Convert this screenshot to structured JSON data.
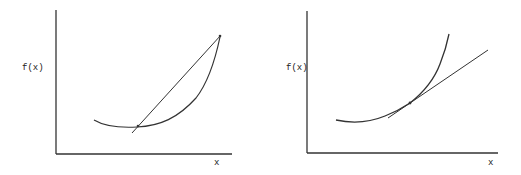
{
  "panels": [
    {
      "id": "left",
      "ylabel": "f(x)",
      "xlabel": "x",
      "description": "Convex curve with secant line through two points on the curve"
    },
    {
      "id": "right",
      "ylabel": "f(x)",
      "xlabel": "x",
      "description": "Convex curve with tangent line at a point"
    }
  ],
  "colors": {
    "ink": "#333333",
    "background": "#ffffff"
  }
}
